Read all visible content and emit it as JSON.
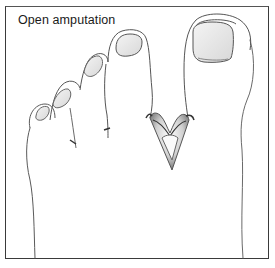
{
  "figure": {
    "title": "Open amputation",
    "annotation": "open-amputation-v-wound-between-first-and-second-toe"
  },
  "colors": {
    "border": "#3a3a3a",
    "line": "#555555",
    "shade": "#8a8a8a",
    "wound": "#6a6a6a",
    "background": "#ffffff"
  }
}
